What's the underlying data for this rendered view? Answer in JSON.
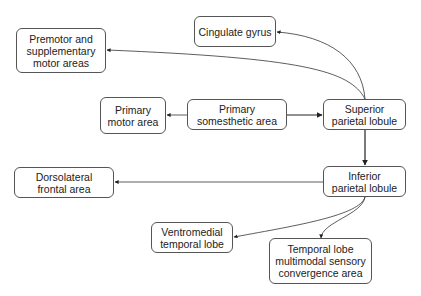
{
  "diagram": {
    "nodes": [
      {
        "id": "cingulate",
        "label": "Cingulate gyrus"
      },
      {
        "id": "premotor",
        "label": "Premotor and\nsupplementary\nmotor areas"
      },
      {
        "id": "primary-motor",
        "label": "Primary\nmotor area"
      },
      {
        "id": "primary-somesthetic",
        "label": "Primary\nsomesthetic area"
      },
      {
        "id": "superior-parietal",
        "label": "Superior\nparietal lobule"
      },
      {
        "id": "dorsolateral-frontal",
        "label": "Dorsolateral\nfrontal area"
      },
      {
        "id": "inferior-parietal",
        "label": "Inferior\nparietal lobule"
      },
      {
        "id": "ventromedial-temporal",
        "label": "Ventromedial\ntemporal lobe"
      },
      {
        "id": "temporal-multimodal",
        "label": "Temporal lobe\nmultimodal sensory\nconvergence area"
      }
    ],
    "edges": [
      {
        "from": "primary-somesthetic",
        "to": "primary-motor"
      },
      {
        "from": "primary-somesthetic",
        "to": "superior-parietal"
      },
      {
        "from": "superior-parietal",
        "to": "cingulate"
      },
      {
        "from": "superior-parietal",
        "to": "premotor"
      },
      {
        "from": "superior-parietal",
        "to": "inferior-parietal"
      },
      {
        "from": "inferior-parietal",
        "to": "dorsolateral-frontal"
      },
      {
        "from": "inferior-parietal",
        "to": "ventromedial-temporal"
      },
      {
        "from": "inferior-parietal",
        "to": "temporal-multimodal"
      }
    ]
  }
}
